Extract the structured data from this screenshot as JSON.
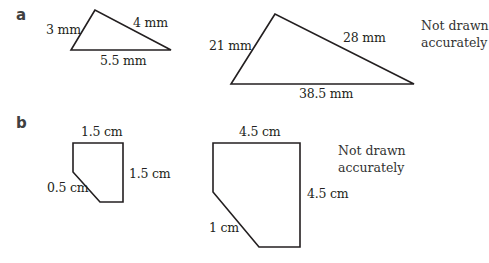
{
  "part_a": {
    "label": "a",
    "small_triangle": {
      "sides": {
        "left": "3 mm",
        "right": "4 mm",
        "base": "5.5 mm"
      },
      "points": "95,10 71,50 171,50"
    },
    "large_triangle": {
      "sides": {
        "left": "21 mm",
        "right": "28 mm",
        "base": "38.5 mm"
      },
      "points": "275,14 231,84 414,84"
    },
    "note": {
      "line1": "Not drawn",
      "line2": "accurately"
    }
  },
  "part_b": {
    "label": "b",
    "small_pentagon": {
      "sides": {
        "top": "1.5 cm",
        "right": "1.5 cm",
        "diagonal": "0.5 cm"
      },
      "points": "73,143 123,143 123,202 100,202 73,172"
    },
    "large_pentagon": {
      "sides": {
        "top": "4.5 cm",
        "right": "4.5 cm",
        "diagonal": "1 cm"
      },
      "points": "213,143 300,143 300,247 259,247 213,192"
    },
    "note": {
      "line1": "Not drawn",
      "line2": "accurately"
    }
  }
}
